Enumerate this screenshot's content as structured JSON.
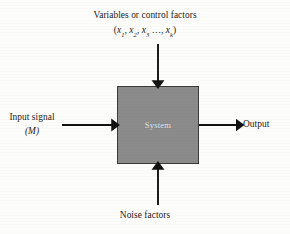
{
  "diagram": {
    "type": "block-diagram",
    "background_color": "#fdfdfc",
    "box": {
      "label": "System",
      "fill_color": "#8b8b8b",
      "border_color": "#3b3b3b",
      "label_color": "#f2f2f2"
    },
    "top_input": {
      "label_line1": "Variables or control factors",
      "label_line2_open": "(",
      "var1": "x",
      "var1_sub": "1",
      "sep1": ", ",
      "var2": "x",
      "var2_sub": "2",
      "sep2": ", ",
      "var3": "x",
      "var3_sub": "3",
      "ellipsis": " …, ",
      "vark": "x",
      "vark_sub": "k",
      "label_line2_close": ")",
      "arrow_direction": "down"
    },
    "left_input": {
      "label_line1": "Input signal",
      "label_line2": "(M)",
      "arrow_direction": "right"
    },
    "right_output": {
      "label": "Output",
      "arrow_direction": "right"
    },
    "bottom_input": {
      "label": "Noise factors",
      "arrow_direction": "up"
    },
    "arrow_color": "#121212"
  }
}
